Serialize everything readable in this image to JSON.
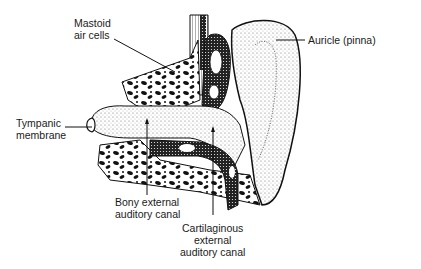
{
  "diagram": {
    "labels": {
      "mastoid": "Mastoid\nair cells",
      "auricle": "Auricle (pinna)",
      "tympanic": "Tympanic\nmembrane",
      "bony_canal": "Bony external\nauditory canal",
      "cartilaginous_canal": "Cartilaginous\nexternal\nauditory canal"
    },
    "colors": {
      "ink": "#1a1a1a",
      "background": "#ffffff",
      "stipple": "#555555"
    }
  }
}
